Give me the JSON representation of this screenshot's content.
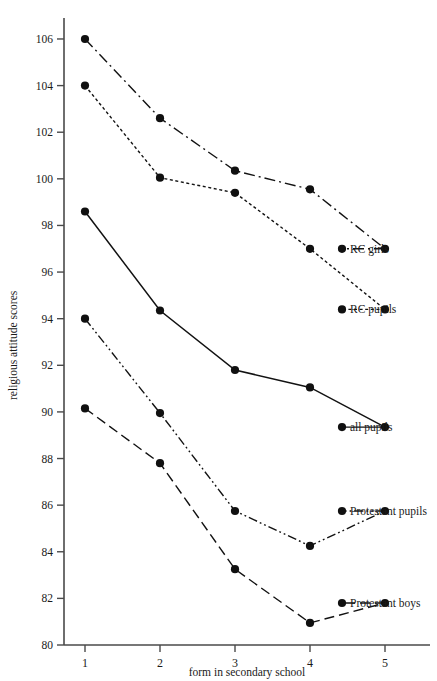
{
  "chart_data": {
    "type": "line",
    "title": "",
    "xlabel": "form in secondary school",
    "ylabel": "religious attitude scores",
    "categories": [
      "1",
      "2",
      "3",
      "4",
      "5"
    ],
    "x": [
      1,
      2,
      3,
      4,
      5
    ],
    "xlim": [
      0.72,
      5.6
    ],
    "ylim": [
      80,
      106.9
    ],
    "ytick_labels": [
      "80",
      "82",
      "84",
      "86",
      "88",
      "90",
      "92",
      "94",
      "96",
      "98",
      "100",
      "102",
      "104",
      "106"
    ],
    "yticks": [
      80,
      82,
      84,
      86,
      88,
      90,
      92,
      94,
      96,
      98,
      100,
      102,
      104,
      106
    ],
    "ytick_step": 2,
    "xtick_labels": [
      "1",
      "2",
      "3",
      "4",
      "5"
    ],
    "grid": false,
    "legend_position": "right-inline-end-of-line",
    "series": [
      {
        "name": "RC girls",
        "label": "RC girls",
        "linestyle": "dash-dot",
        "dasharray": "11 4 2 4",
        "values": [
          106.0,
          102.6,
          100.35,
          99.55,
          97.0
        ],
        "label_value": 97.0
      },
      {
        "name": "RC pupils",
        "label": "RC pupils",
        "linestyle": "fine-dotted-dash",
        "dasharray": "3 2.6",
        "values": [
          104.0,
          100.05,
          99.4,
          97.0,
          94.4
        ],
        "label_value": 94.4
      },
      {
        "name": "all pupils",
        "label": "all pupils",
        "linestyle": "solid",
        "dasharray": "none",
        "values": [
          98.6,
          94.35,
          91.8,
          91.05,
          89.35
        ],
        "label_value": 89.35
      },
      {
        "name": "Protestant pupils",
        "label": "Protestant pupils",
        "linestyle": "dash-dot-dot",
        "dasharray": "9 3 1.8 3 1.8 3",
        "values": [
          94.0,
          89.95,
          85.75,
          84.25,
          85.75
        ],
        "label_value": 85.75
      },
      {
        "name": "Protestant boys",
        "label": "Protestant boys",
        "linestyle": "long-dash",
        "dasharray": "10 5",
        "values": [
          90.15,
          87.8,
          83.25,
          80.95,
          81.8
        ],
        "label_value": 81.8
      }
    ],
    "colors": {
      "ink": "#101010",
      "axis": "#4a4a4a",
      "background": "#ffffff"
    }
  }
}
